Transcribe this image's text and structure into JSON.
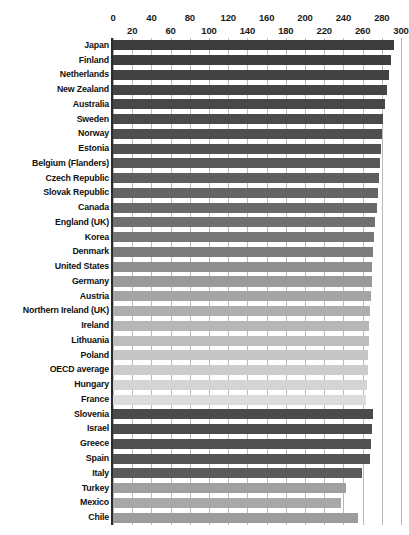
{
  "chart_data": {
    "type": "bar",
    "orientation": "horizontal",
    "title": "",
    "xlabel": "",
    "ylabel": "",
    "xlim": [
      0,
      300
    ],
    "grid": true,
    "legend": false,
    "tick_interval": 20,
    "tick_labels_top": [
      "0",
      "40",
      "80",
      "120",
      "160",
      "200",
      "240",
      "280"
    ],
    "tick_labels_bottom": [
      "20",
      "60",
      "100",
      "140",
      "180",
      "220",
      "260",
      "300"
    ],
    "tick_values_top": [
      0,
      40,
      80,
      120,
      160,
      200,
      240,
      280
    ],
    "tick_values_bottom": [
      20,
      60,
      100,
      140,
      180,
      220,
      260,
      300
    ],
    "categories": [
      "Japan",
      "Finland",
      "Netherlands",
      "New Zealand",
      "Australia",
      "Sweden",
      "Norway",
      "Estonia",
      "Belgium (Flanders)",
      "Czech Republic",
      "Slovak Republic",
      "Canada",
      "England (UK)",
      "Korea",
      "Denmark",
      "United States",
      "Germany",
      "Austria",
      "Northern Ireland (UK)",
      "Ireland",
      "Lithuania",
      "Poland",
      "OECD average",
      "Hungary",
      "France",
      "Slovenia",
      "Israel",
      "Greece",
      "Spain",
      "Italy",
      "Turkey",
      "Mexico",
      "Chile"
    ],
    "values": [
      293,
      290,
      288,
      285,
      283,
      281,
      280,
      279,
      278,
      277,
      276,
      275,
      273,
      272,
      271,
      270,
      270,
      269,
      268,
      267,
      267,
      266,
      266,
      265,
      264,
      271,
      270,
      269,
      268,
      259,
      243,
      238,
      255
    ],
    "bar_colors": [
      "#3c3c3c",
      "#3f3f3f",
      "#424242",
      "#454545",
      "#484848",
      "#4b4b4b",
      "#4e4e4e",
      "#525252",
      "#585858",
      "#5e5e5e",
      "#646464",
      "#6a6a6a",
      "#707070",
      "#767676",
      "#7c7c7c",
      "#8f8f8f",
      "#9a9a9a",
      "#a4a4a4",
      "#aeaeae",
      "#b6b6b6",
      "#bebebe",
      "#c6c6c6",
      "#cccccc",
      "#d4d4d4",
      "#dcdcdc",
      "#4a4a4a",
      "#4d4d4d",
      "#515151",
      "#555555",
      "#5a5a5a",
      "#a0a0a0",
      "#a8a8a8",
      "#9c9c9c"
    ]
  },
  "axis": {
    "zero_px": 113,
    "px_per_unit": 0.96
  }
}
